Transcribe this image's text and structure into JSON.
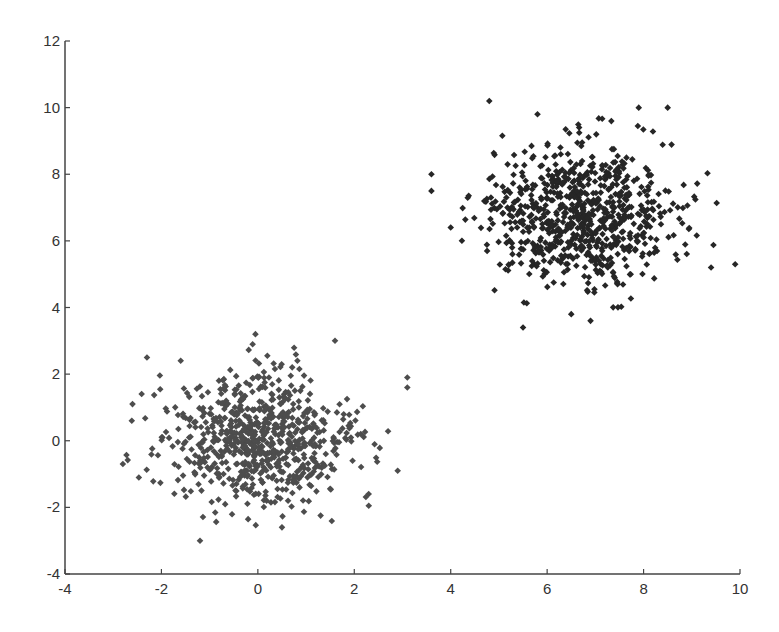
{
  "chart_data": {
    "type": "scatter",
    "title": "",
    "xlabel": "",
    "ylabel": "",
    "xlim": [
      -4,
      10
    ],
    "ylim": [
      -4,
      12
    ],
    "grid": false,
    "legend": null,
    "x_ticks": [
      -4,
      -2,
      0,
      2,
      4,
      6,
      8,
      10
    ],
    "y_ticks": [
      -4,
      -2,
      0,
      2,
      4,
      6,
      8,
      10,
      12
    ],
    "marker": "diamond",
    "series": [
      {
        "name": "cluster-1",
        "color": "#4d4d4d",
        "distribution": "gaussian",
        "center": [
          0.0,
          0.0
        ],
        "std": [
          0.95,
          1.0
        ],
        "count": 750,
        "seed": 12345,
        "outliers": [
          [
            -2.3,
            2.5
          ],
          [
            -0.05,
            3.2
          ],
          [
            3.1,
            1.9
          ],
          [
            3.1,
            1.6
          ],
          [
            -1.2,
            -3.0
          ],
          [
            -2.8,
            -0.7
          ],
          [
            2.3,
            -1.95
          ],
          [
            -1.6,
            2.4
          ],
          [
            1.6,
            3.0
          ],
          [
            2.9,
            -0.9
          ],
          [
            -2.6,
            1.1
          ],
          [
            0.5,
            -2.6
          ]
        ]
      },
      {
        "name": "cluster-2",
        "color": "#262626",
        "distribution": "gaussian",
        "center": [
          6.7,
          6.8
        ],
        "std": [
          1.0,
          1.0
        ],
        "count": 750,
        "seed": 67890,
        "outliers": [
          [
            4.8,
            10.2
          ],
          [
            7.9,
            10.0
          ],
          [
            8.5,
            10.0
          ],
          [
            9.9,
            5.3
          ],
          [
            3.6,
            8.0
          ],
          [
            3.6,
            7.5
          ],
          [
            5.5,
            3.4
          ],
          [
            6.9,
            3.6
          ],
          [
            6.5,
            3.8
          ],
          [
            5.8,
            9.8
          ],
          [
            9.4,
            5.2
          ],
          [
            4.0,
            6.4
          ]
        ]
      }
    ]
  },
  "layout": {
    "plot_left": 65,
    "plot_right": 740,
    "plot_top": 41,
    "plot_bottom": 574,
    "axis_color": "#444444",
    "tick_length": 5
  }
}
